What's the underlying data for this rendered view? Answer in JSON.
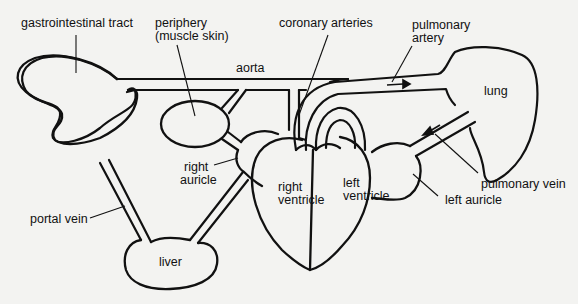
{
  "diagram": {
    "colors": {
      "stroke": "#111111",
      "background": "#f3f3f1"
    },
    "labels": {
      "gastrointestinal_tract": "gastrointestinal tract",
      "periphery_line1": "periphery",
      "periphery_line2": "(muscle skin)",
      "coronary_arteries": "coronary arteries",
      "pulmonary_artery_line1": "pulmonary",
      "pulmonary_artery_line2": "artery",
      "aorta": "aorta",
      "lung": "lung",
      "right_auricle_line1": "right",
      "right_auricle_line2": "auricle",
      "right_ventricle_line1": "right",
      "right_ventricle_line2": "ventricle",
      "left_ventricle_line1": "left",
      "left_ventricle_line2": "ventricle",
      "pulmonary_vein": "pulmonary vein",
      "left_auricle": "left auricle",
      "portal_vein": "portal vein",
      "liver": "liver"
    },
    "flow_arrows": [
      {
        "vessel": "pulmonary artery",
        "direction": "right"
      },
      {
        "vessel": "pulmonary vein",
        "direction": "down-left"
      }
    ]
  }
}
